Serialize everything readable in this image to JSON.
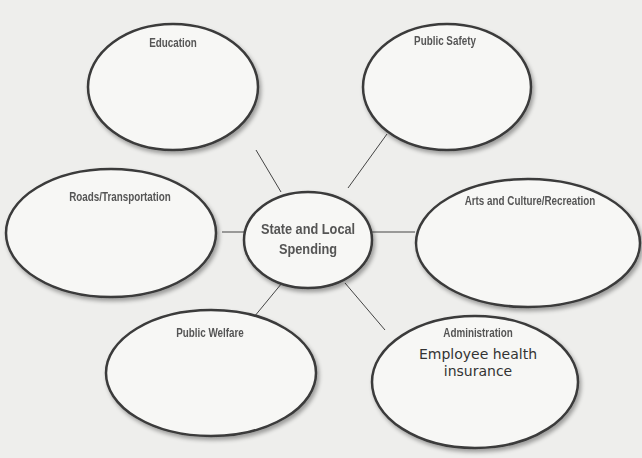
{
  "diagram": {
    "type": "web-organizer",
    "center": {
      "label_line1": "State and Local",
      "label_line2": "Spending"
    },
    "nodes": [
      {
        "id": "education",
        "label": "Education",
        "entries": []
      },
      {
        "id": "public-safety",
        "label": "Public Safety",
        "entries": []
      },
      {
        "id": "roads-transportation",
        "label": "Roads/Transportation",
        "entries": []
      },
      {
        "id": "arts-culture-recreation",
        "label": "Arts and Culture/Recreation",
        "entries": []
      },
      {
        "id": "public-welfare",
        "label": "Public Welfare",
        "entries": []
      },
      {
        "id": "administration",
        "label": "Administration",
        "entries": [
          "Employee health",
          "insurance"
        ]
      }
    ]
  }
}
